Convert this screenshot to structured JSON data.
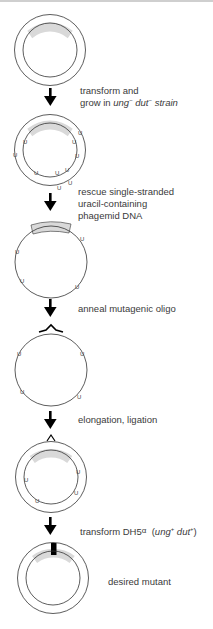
{
  "diagram": {
    "colors": {
      "stroke": "#333333",
      "insert_fill": "#d9d9d9",
      "mutation_fill": "#000000",
      "text": "#3a3a3a"
    },
    "steps": [
      {
        "id": "step-1",
        "label_line1": "transform and",
        "label_line2_prefix": "grow in ",
        "label_line2_gene1": "ung",
        "label_line2_sup1": "−",
        "label_line2_gene2": "dut",
        "label_line2_sup2": "−",
        "label_line2_suffix": " strain"
      },
      {
        "id": "step-2",
        "label_line1": "rescue single-stranded",
        "label_line2": "uracil-containing",
        "label_line3": "phagemid DNA"
      },
      {
        "id": "step-3",
        "label_line1": "anneal mutagenic oligo"
      },
      {
        "id": "step-4",
        "label_line1": "elongation, ligation"
      },
      {
        "id": "step-5",
        "label_prefix": "transform DH5",
        "label_alpha": "α",
        "label_gene1": "ung",
        "label_sup1": "+",
        "label_gene2": "dut",
        "label_sup2": "+"
      },
      {
        "id": "step-6",
        "label_line1": "desired mutant"
      }
    ],
    "uracil_marker": "U",
    "plasmids": [
      {
        "name": "parent-phagemid",
        "type": "double-stranded",
        "insert": true,
        "uracils": 0
      },
      {
        "name": "uracil-containing-phagemid",
        "type": "double-stranded",
        "insert": true,
        "uracils": 10
      },
      {
        "name": "single-stranded-template",
        "type": "single-stranded",
        "insert": true,
        "uracils": 4
      },
      {
        "name": "annealed-template",
        "type": "single-stranded",
        "insert": false,
        "uracils": 4,
        "oligo": true
      },
      {
        "name": "heteroduplex",
        "type": "double-stranded",
        "insert": true,
        "uracils": 4,
        "mismatch": true
      },
      {
        "name": "desired-mutant",
        "type": "double-stranded",
        "insert": true,
        "uracils": 0,
        "mutation": true
      }
    ]
  }
}
